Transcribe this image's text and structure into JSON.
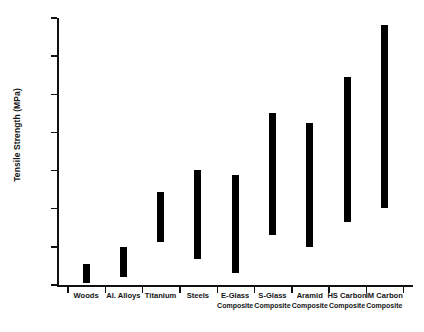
{
  "chart_data": {
    "type": "bar",
    "bar_style": "floating-range",
    "title": "",
    "xlabel": "",
    "ylabel": "Tensile Strength (MPa)",
    "ylim": [
      0,
      2800
    ],
    "ytick_values": [
      0,
      400,
      800,
      1200,
      1600,
      2000,
      2400,
      2800
    ],
    "ytick_labels": [
      "0",
      "400",
      "800",
      "1200",
      "1600",
      "2000",
      "2400",
      "2800"
    ],
    "grid": false,
    "legend": false,
    "orientation": "vertical",
    "categories": [
      "Woods",
      "Al. Alloys",
      "Titanium",
      "Steels",
      "E-Glass Composite",
      "S-Glass Composite",
      "Aramid Composite",
      "HS Carbon Composite",
      "IM Carbon Composite"
    ],
    "category_labels": [
      {
        "line1": "Woods",
        "line2": ""
      },
      {
        "line1": "Al. Alloys",
        "line2": ""
      },
      {
        "line1": "Titanium",
        "line2": ""
      },
      {
        "line1": "Steels",
        "line2": ""
      },
      {
        "line1": "E-Glass",
        "line2": "Composite"
      },
      {
        "line1": "S-Glass",
        "line2": "Composite"
      },
      {
        "line1": "Aramid",
        "line2": "Composite"
      },
      {
        "line1": "HS Carbon",
        "line2": "Composite"
      },
      {
        "line1": "IM Carbon",
        "line2": "Composite"
      }
    ],
    "series": [
      {
        "name": "low",
        "values": [
          20,
          80,
          450,
          270,
          130,
          520,
          400,
          660,
          810
        ]
      },
      {
        "name": "high",
        "values": [
          220,
          400,
          980,
          1210,
          1150,
          1800,
          1700,
          2180,
          2730
        ]
      }
    ],
    "ranges": [
      {
        "category": "Woods",
        "low": 20,
        "high": 220
      },
      {
        "category": "Al. Alloys",
        "low": 80,
        "high": 400
      },
      {
        "category": "Titanium",
        "low": 450,
        "high": 980
      },
      {
        "category": "Steels",
        "low": 270,
        "high": 1210
      },
      {
        "category": "E-Glass Composite",
        "low": 130,
        "high": 1150
      },
      {
        "category": "S-Glass Composite",
        "low": 520,
        "high": 1800
      },
      {
        "category": "Aramid Composite",
        "low": 400,
        "high": 1700
      },
      {
        "category": "HS Carbon Composite",
        "low": 660,
        "high": 2180
      },
      {
        "category": "IM Carbon Composite",
        "low": 810,
        "high": 2730
      }
    ],
    "bar_color": "#000000",
    "axis_color": "#111111",
    "background_color": "#ffffff"
  }
}
